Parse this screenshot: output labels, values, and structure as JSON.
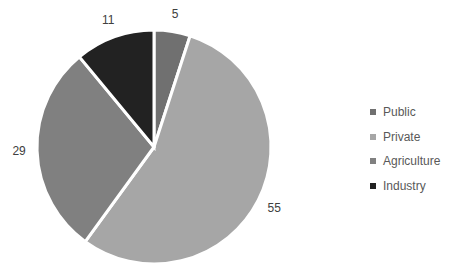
{
  "chart_data": {
    "type": "pie",
    "title": "",
    "categories": [
      "Public",
      "Private",
      "Agriculture",
      "Industry"
    ],
    "values": [
      5,
      55,
      29,
      11
    ],
    "colors": [
      "#707070",
      "#a6a6a6",
      "#808080",
      "#222222"
    ],
    "data_labels": [
      "5",
      "55",
      "29",
      "11"
    ],
    "legend_position": "right",
    "start_angle_deg": 0,
    "direction": "clockwise"
  },
  "legend": {
    "items": [
      {
        "label": "Public",
        "color": "#707070"
      },
      {
        "label": "Private",
        "color": "#a6a6a6"
      },
      {
        "label": "Agriculture",
        "color": "#808080"
      },
      {
        "label": "Industry",
        "color": "#222222"
      }
    ]
  }
}
